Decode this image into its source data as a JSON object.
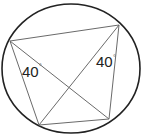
{
  "diagram": {
    "type": "inscribed-quadrilateral-in-circle",
    "circle": {
      "cx": 71,
      "cy": 68.5,
      "rx": 69,
      "ry": 64.5,
      "stroke": "#222222"
    },
    "vertices": {
      "A": {
        "x": 10,
        "y": 41
      },
      "B": {
        "x": 119,
        "y": 25
      },
      "C": {
        "x": 109,
        "y": 119
      },
      "D": {
        "x": 39,
        "y": 125
      }
    },
    "segments": [
      "AB",
      "BC",
      "CD",
      "DA",
      "AC",
      "BD"
    ],
    "line_color": "#6a6a6a",
    "angle_labels": [
      {
        "text": "40",
        "degree_symbol": "°",
        "x": 22,
        "y": 77,
        "at_vertex": "A"
      },
      {
        "text": "40",
        "degree_symbol": "°",
        "x": 96,
        "y": 67,
        "at_vertex": "B"
      }
    ]
  }
}
